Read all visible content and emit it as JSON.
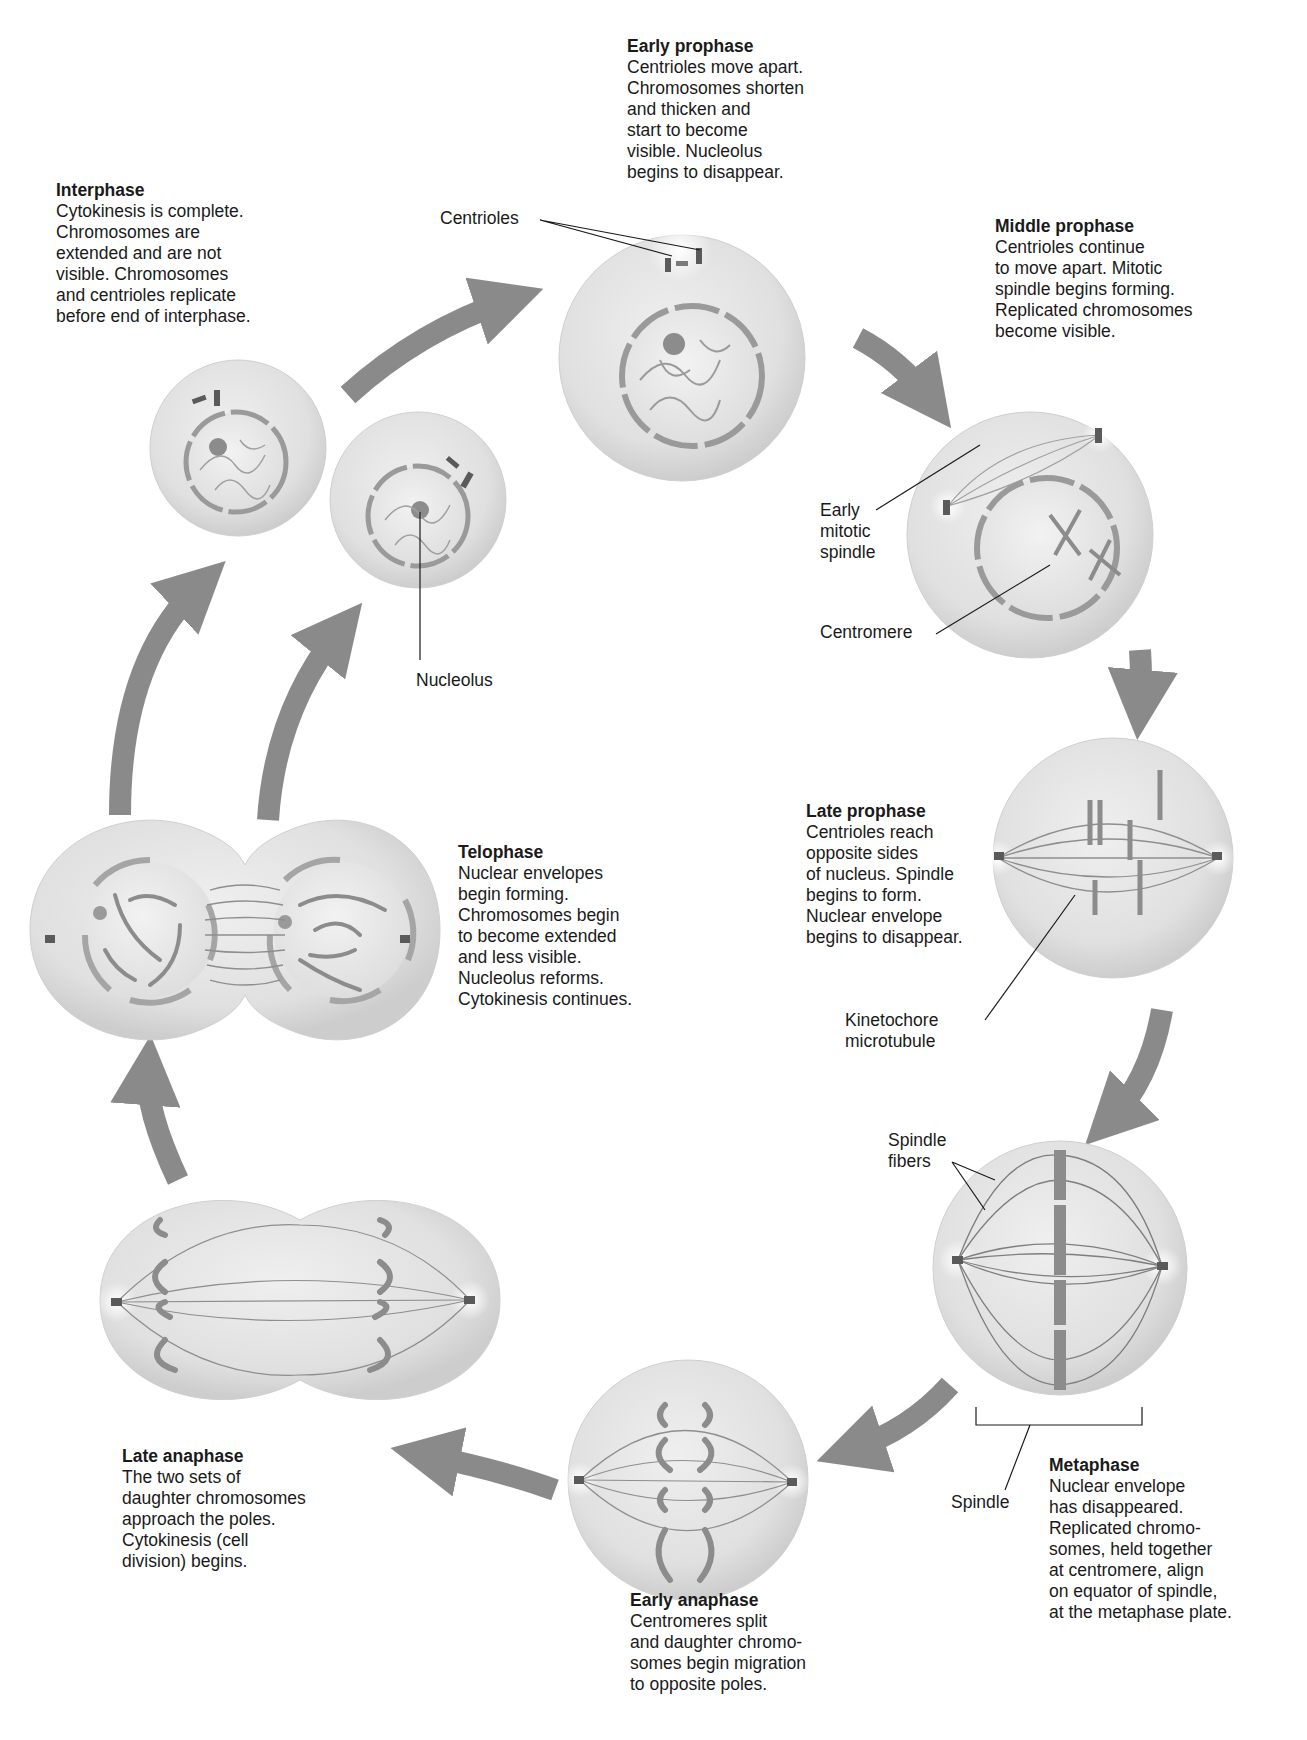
{
  "diagram": {
    "colors": {
      "cytoplasm": "#e4e4e4",
      "cytoplasm_edge": "#cfcfcf",
      "nucleus": "#ececec",
      "envelope": "#9a9a9a",
      "chromosome": "#8c8c8c",
      "arrow": "#8a8a8a",
      "text": "#1a1a1a"
    }
  },
  "stages": {
    "interphase": {
      "title": "Interphase",
      "lines": [
        "Cytokinesis is complete.",
        "Chromosomes are",
        "extended and are not",
        "visible. Chromosomes",
        "and centrioles replicate",
        "before end of interphase."
      ]
    },
    "early_prophase": {
      "title": "Early prophase",
      "lines": [
        "Centrioles move apart.",
        "Chromosomes shorten",
        "and thicken and",
        "start to become",
        "visible. Nucleolus",
        "begins to disappear."
      ]
    },
    "middle_prophase": {
      "title": "Middle prophase",
      "lines": [
        "Centrioles continue",
        "to move apart. Mitotic",
        "spindle begins forming.",
        "Replicated chromosomes",
        "become visible."
      ]
    },
    "late_prophase": {
      "title": "Late prophase",
      "lines": [
        "Centrioles reach",
        "opposite sides",
        "of nucleus. Spindle",
        "begins to form.",
        "Nuclear envelope",
        "begins to disappear."
      ]
    },
    "metaphase": {
      "title": "Metaphase",
      "lines": [
        "Nuclear envelope",
        "has disappeared.",
        "Replicated chromo-",
        "somes, held together",
        "at centromere, align",
        "on equator of spindle,",
        "at the metaphase plate."
      ]
    },
    "early_anaphase": {
      "title": "Early anaphase",
      "lines": [
        "Centromeres split",
        "and daughter chromo-",
        "somes begin migration",
        "to opposite poles."
      ]
    },
    "late_anaphase": {
      "title": "Late anaphase",
      "lines": [
        "The two sets of",
        "daughter chromosomes",
        "approach the poles.",
        "Cytokinesis (cell",
        "division) begins."
      ]
    },
    "telophase": {
      "title": "Telophase",
      "lines": [
        "Nuclear envelopes",
        "begin forming.",
        "Chromosomes begin",
        "to become extended",
        "and less visible.",
        "Nucleolus reforms.",
        "Cytokinesis continues."
      ]
    }
  },
  "labels": {
    "centrioles": "Centrioles",
    "nucleolus": "Nucleolus",
    "early_mitotic_spindle": [
      "Early",
      "mitotic",
      "spindle"
    ],
    "centromere": "Centromere",
    "kinetochore_microtubule": [
      "Kinetochore",
      "microtubule"
    ],
    "spindle_fibers": [
      "Spindle",
      "fibers"
    ],
    "spindle": "Spindle"
  }
}
